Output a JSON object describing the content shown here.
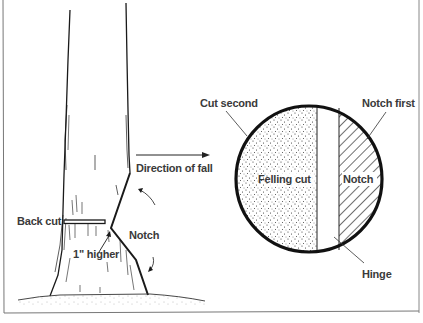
{
  "figure": {
    "tree_side": {
      "labels": {
        "direction": "Direction of fall",
        "back_cut": "Back cut",
        "notch": "Notch",
        "higher": "1\" higher"
      }
    },
    "stump_top": {
      "labels": {
        "cut_second": "Cut second",
        "notch_first": "Notch first",
        "felling_cut": "Felling cut",
        "notch": "Notch",
        "hinge": "Hinge"
      }
    }
  },
  "colors": {
    "ink": "#1a1a1a",
    "text": "#3a3a3a",
    "frame": "#888888",
    "background": "#ffffff"
  }
}
